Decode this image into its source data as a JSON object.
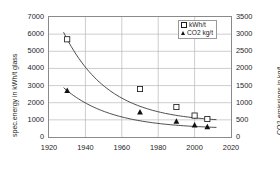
{
  "chart_data": {
    "type": "scatter",
    "title": "",
    "xlabel": "",
    "ylabel": "spec.energy in kWh/t glass",
    "ylabel_right": "CO2-emissions in kg/t",
    "xlim": [
      1920,
      2020
    ],
    "ylim": [
      0,
      7000
    ],
    "ylim_right": [
      0,
      3500
    ],
    "xticks": [
      "1920",
      "1940",
      "1960",
      "1980",
      "2000",
      "2020"
    ],
    "yticks_left": [
      "0",
      "1000",
      "2000",
      "3000",
      "4000",
      "5000",
      "6000",
      "7000"
    ],
    "yticks_right": [
      "0",
      "500",
      "1000",
      "1500",
      "2000",
      "2500",
      "3000",
      "3500"
    ],
    "grid": true,
    "legend_position": "top-right",
    "series": [
      {
        "name": "kWh/t",
        "marker": "open-square",
        "axis": "left",
        "points": [
          {
            "x": 1930,
            "y": 5700
          },
          {
            "x": 1970,
            "y": 2800
          },
          {
            "x": 1990,
            "y": 1750
          },
          {
            "x": 2000,
            "y": 1250
          },
          {
            "x": 2007,
            "y": 1050
          }
        ],
        "trend": "exponential-decay"
      },
      {
        "name": "CO2 kg/t",
        "marker": "filled-triangle",
        "axis": "right",
        "points": [
          {
            "x": 1930,
            "y": 1350
          },
          {
            "x": 1970,
            "y": 720
          },
          {
            "x": 1990,
            "y": 450
          },
          {
            "x": 2000,
            "y": 340
          },
          {
            "x": 2007,
            "y": 290
          }
        ],
        "trend": "exponential-decay"
      }
    ]
  },
  "axes": {
    "left_title": "spec.energy in kWh/t glass",
    "right_title": "CO2-emissions in kg/t"
  },
  "legend": {
    "entries": [
      {
        "label": "kWh/t"
      },
      {
        "label": "CO2 kg/t"
      }
    ]
  },
  "colors": {
    "frame": "#8a8a8a",
    "grid": "#b8b8b8",
    "curve": "#3a3a3a",
    "marker": "#111111",
    "text": "#1d1d1d"
  }
}
